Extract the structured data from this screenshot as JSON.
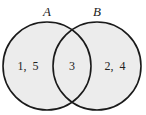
{
  "diagram": {
    "type": "venn",
    "colors": {
      "fill": "#ececec",
      "stroke": "#1a1a1a",
      "background": "#ffffff"
    },
    "sets": [
      {
        "name": "A",
        "only_elements": "1,  5"
      },
      {
        "name": "B",
        "only_elements": "2,  4"
      }
    ],
    "intersection": "3"
  }
}
